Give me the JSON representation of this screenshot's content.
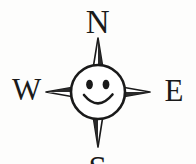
{
  "figure": {
    "background_color": "#fdfdfc",
    "ink_color": "#1a1a1a",
    "face_fill_color": "#ffffff"
  },
  "cardinal_points": {
    "north": "N",
    "west": "W",
    "east": "E",
    "south": "S"
  },
  "compass": {
    "center_x": 98,
    "center_y": 92,
    "face_radius": 27,
    "point_north_tip_y": 38,
    "point_south_tip_y": 147,
    "point_west_tip_x": 46,
    "point_east_tip_x": 150
  },
  "face": {
    "eye_left_label": "left-eye",
    "eye_right_label": "right-eye",
    "mouth_label": "smile"
  }
}
